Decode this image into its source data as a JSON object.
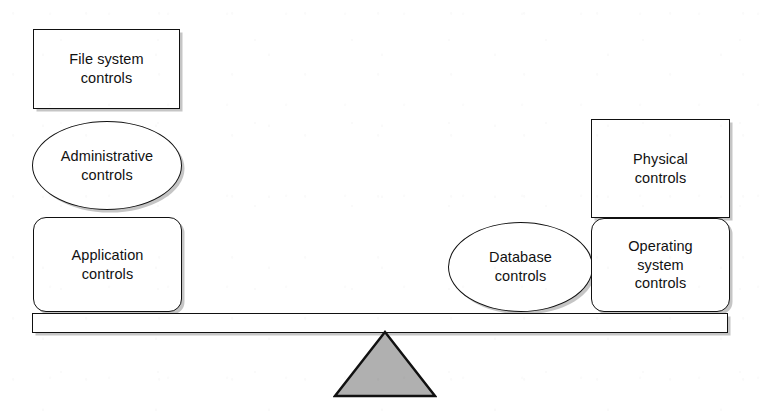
{
  "diagram": {
    "type": "balance-scale",
    "background_color": "#ffffff",
    "stroke_color": "#111111",
    "fill_color": "#ffffff",
    "fulcrum_fill_color": "#b0b0b0",
    "shadow_color": "#969696",
    "left_pan": {
      "name": "left-stack",
      "items": [
        {
          "id": "file-system-controls",
          "label": "File system\ncontrols",
          "shape": "rectangle"
        },
        {
          "id": "administrative-controls",
          "label": "Administrative\ncontrols",
          "shape": "ellipse"
        },
        {
          "id": "application-controls",
          "label": "Application\ncontrols",
          "shape": "rounded-rectangle"
        }
      ]
    },
    "right_pan": {
      "name": "right-stack",
      "items": [
        {
          "id": "physical-controls",
          "label": "Physical\ncontrols",
          "shape": "rectangle"
        },
        {
          "id": "operating-system-controls",
          "label": "Operating\nsystem\ncontrols",
          "shape": "rounded-rectangle"
        }
      ]
    },
    "center": {
      "name": "center-group",
      "items": [
        {
          "id": "database-controls",
          "label": "Database\ncontrols",
          "shape": "ellipse"
        }
      ]
    },
    "beam": {
      "id": "balance-beam",
      "label": ""
    },
    "fulcrum": {
      "id": "fulcrum-triangle",
      "label": ""
    }
  }
}
